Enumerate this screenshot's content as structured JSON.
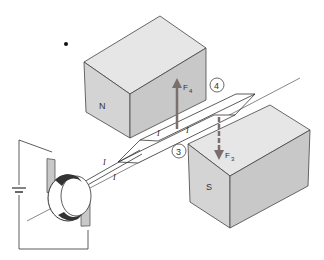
{
  "diagram": {
    "magnets": {
      "north_label": "N",
      "south_label": "S"
    },
    "forces": {
      "top": {
        "label": "F",
        "subscript": "4"
      },
      "bottom": {
        "label": "F",
        "subscript": "3"
      }
    },
    "sides": {
      "side_4": "4",
      "side_3": "3"
    },
    "current_label": "I",
    "colors": {
      "magnet_top": "#e4e4e4",
      "magnet_front": "#d2d2d2",
      "magnet_side": "#c2c2c2",
      "force_arrow": "#7a6e6e",
      "commutator_dark": "#333333",
      "brush": "#c8c8c8",
      "line": "#333333"
    }
  }
}
